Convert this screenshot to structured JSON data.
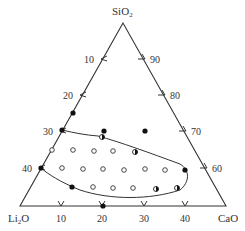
{
  "diagram": {
    "type": "ternary",
    "vertices": {
      "top": {
        "label": "SiO",
        "sub": "2",
        "x": 123,
        "y": 23
      },
      "left": {
        "label": "Li",
        "sub": "2",
        "suffix": "O",
        "x": 20,
        "y": 206
      },
      "right": {
        "label": "CaO",
        "x": 226,
        "y": 206
      }
    },
    "colors": {
      "line": "#333333",
      "text": "#333333",
      "background": "#ffffff"
    },
    "left_axis_ticks": [
      {
        "label": "10",
        "x": 102,
        "y": 59
      },
      {
        "label": "20",
        "x": 81,
        "y": 95
      },
      {
        "label": "30",
        "x": 61,
        "y": 131
      },
      {
        "label": "40",
        "x": 40,
        "y": 168
      }
    ],
    "right_axis_ticks": [
      {
        "label": "90",
        "x": 144,
        "y": 59
      },
      {
        "label": "80",
        "x": 164,
        "y": 95
      },
      {
        "label": "70",
        "x": 185,
        "y": 131
      },
      {
        "label": "60",
        "x": 206,
        "y": 168
      }
    ],
    "bottom_axis_ticks": [
      {
        "label": "10",
        "x": 61,
        "y": 206
      },
      {
        "label": "20",
        "x": 102,
        "y": 206
      },
      {
        "label": "30",
        "x": 144,
        "y": 206
      },
      {
        "label": "40",
        "x": 185,
        "y": 206
      }
    ],
    "points": [
      {
        "x": 73,
        "y": 113,
        "type": "filled"
      },
      {
        "x": 62,
        "y": 130,
        "type": "filled"
      },
      {
        "x": 104,
        "y": 131,
        "type": "filled"
      },
      {
        "x": 145,
        "y": 131,
        "type": "filled"
      },
      {
        "x": 102,
        "y": 137,
        "type": "half"
      },
      {
        "x": 52,
        "y": 150,
        "type": "open"
      },
      {
        "x": 73,
        "y": 150,
        "type": "open"
      },
      {
        "x": 94,
        "y": 151,
        "type": "open"
      },
      {
        "x": 113,
        "y": 151,
        "type": "open"
      },
      {
        "x": 135,
        "y": 152,
        "type": "half"
      },
      {
        "x": 41,
        "y": 168,
        "type": "filled"
      },
      {
        "x": 62,
        "y": 168,
        "type": "open"
      },
      {
        "x": 83,
        "y": 169,
        "type": "open"
      },
      {
        "x": 103,
        "y": 169,
        "type": "open"
      },
      {
        "x": 124,
        "y": 170,
        "type": "open"
      },
      {
        "x": 145,
        "y": 169,
        "type": "open"
      },
      {
        "x": 165,
        "y": 170,
        "type": "open"
      },
      {
        "x": 185,
        "y": 170,
        "type": "filled"
      },
      {
        "x": 72,
        "y": 187,
        "type": "filled"
      },
      {
        "x": 93,
        "y": 187,
        "type": "open"
      },
      {
        "x": 113,
        "y": 188,
        "type": "open"
      },
      {
        "x": 133,
        "y": 188,
        "type": "open"
      },
      {
        "x": 156,
        "y": 189,
        "type": "half"
      },
      {
        "x": 177,
        "y": 188,
        "type": "half"
      },
      {
        "x": 103,
        "y": 206,
        "type": "filled"
      }
    ],
    "region_boundary": "M62,130 C75,133 85,135 98,136 C120,142 150,153 180,164 C190,170 190,182 180,190 C150,200 110,200 80,190 C60,182 48,174 41,168"
  }
}
